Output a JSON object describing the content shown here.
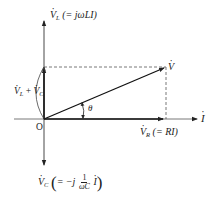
{
  "diagram": {
    "type": "phasor-diagram",
    "origin_label": "O",
    "axis_label_current": "I",
    "angle_label": "θ",
    "labels": {
      "VL": {
        "symbol": "V",
        "subscript": "L",
        "expression": "(= jωLI)"
      },
      "V": {
        "symbol": "V"
      },
      "VLplusVC": {
        "symbol_a": "V",
        "sub_a": "L",
        "plus": "+",
        "symbol_b": "V",
        "sub_b": "C"
      },
      "VR": {
        "symbol": "V",
        "subscript": "R",
        "expression": "(= RI)"
      },
      "VC": {
        "symbol": "V",
        "subscript": "C",
        "prefix": "= −j",
        "frac_num": "1",
        "frac_den": "ωC",
        "suffix": "I"
      }
    },
    "colors": {
      "line": "#222222",
      "axis": "#333333",
      "dashed": "#555555"
    }
  }
}
